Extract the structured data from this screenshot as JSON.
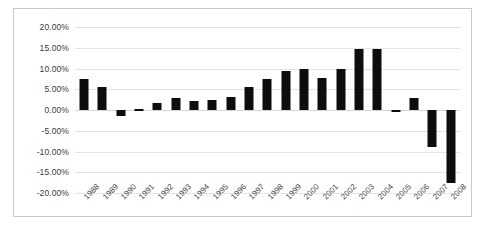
{
  "chart_data": {
    "type": "bar",
    "title": "",
    "xlabel": "",
    "ylabel": "",
    "grid": true,
    "legend": false,
    "ylim": [
      -20,
      20
    ],
    "ytick_step": 5,
    "ytick_labels": [
      "20.00%",
      "15.00%",
      "10.00%",
      "5.00%",
      "0.00%",
      "-5.00%",
      "-10.00%",
      "-15.00%",
      "-20.00%"
    ],
    "ytick_values": [
      20,
      15,
      10,
      5,
      0,
      -5,
      -10,
      -15,
      -20
    ],
    "bar_color": "#0d0d0d",
    "grid_color": "#e3e3e3",
    "frame_color": "#c9c9c9",
    "categories": [
      "1988",
      "1989",
      "1990",
      "1991",
      "1992",
      "1993",
      "1994",
      "1995",
      "1996",
      "1997",
      "1998",
      "1999",
      "2000",
      "2001",
      "2002",
      "2003",
      "2004",
      "2005",
      "2006",
      "2007",
      "2008"
    ],
    "values": [
      7.5,
      5.5,
      -1.5,
      0.2,
      1.8,
      3.0,
      2.2,
      2.5,
      3.2,
      5.5,
      7.5,
      9.5,
      9.8,
      7.8,
      10.0,
      14.8,
      14.8,
      -0.6,
      3.0,
      -9.0,
      -17.5
    ]
  }
}
